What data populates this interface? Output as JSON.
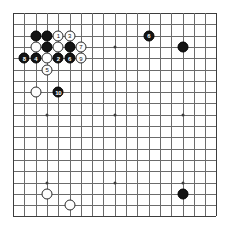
{
  "diagram": {
    "type": "go-board",
    "board_size": 19,
    "colors": {
      "background": "#ffffff",
      "grid": "#6b6b6b",
      "grid_edge": "#3d3d3d",
      "black_stone": "#141414",
      "white_stone": "#fdfdfd",
      "black_label": "#ffffff",
      "white_label": "#111111"
    },
    "geometry": {
      "origin_x": 13,
      "origin_y": 13,
      "spacing": 11.3,
      "stone_diameter": 11,
      "hoshi_points": [
        [
          3,
          3
        ],
        [
          9,
          3
        ],
        [
          15,
          3
        ],
        [
          3,
          9
        ],
        [
          9,
          9
        ],
        [
          15,
          9
        ],
        [
          3,
          15
        ],
        [
          9,
          15
        ],
        [
          15,
          15
        ]
      ]
    },
    "stones": [
      {
        "id": "b-c17",
        "color": "black",
        "col": 2,
        "row": 2,
        "label": ""
      },
      {
        "id": "b-d17",
        "color": "black",
        "col": 3,
        "row": 2,
        "label": ""
      },
      {
        "id": "w-e17",
        "color": "white",
        "col": 4,
        "row": 2,
        "label": "1"
      },
      {
        "id": "w-f17",
        "color": "white",
        "col": 5,
        "row": 2,
        "label": "3"
      },
      {
        "id": "w-c16",
        "color": "white",
        "col": 2,
        "row": 3,
        "label": ""
      },
      {
        "id": "b-d16",
        "color": "black",
        "col": 3,
        "row": 3,
        "label": ""
      },
      {
        "id": "w-e16",
        "color": "white",
        "col": 4,
        "row": 3,
        "label": ""
      },
      {
        "id": "b-f16",
        "color": "black",
        "col": 5,
        "row": 3,
        "label": ""
      },
      {
        "id": "w-g16",
        "color": "white",
        "col": 6,
        "row": 3,
        "label": "7"
      },
      {
        "id": "b-a15",
        "color": "black",
        "col": 1,
        "row": 4,
        "label": "8"
      },
      {
        "id": "b-b15",
        "color": "black",
        "col": 2,
        "row": 4,
        "label": "4"
      },
      {
        "id": "w-c15",
        "color": "white",
        "col": 3,
        "row": 4,
        "label": ""
      },
      {
        "id": "b-d15",
        "color": "black",
        "col": 4,
        "row": 4,
        "label": "2"
      },
      {
        "id": "b-e15",
        "color": "black",
        "col": 5,
        "row": 4,
        "label": "6"
      },
      {
        "id": "w-g15",
        "color": "white",
        "col": 6,
        "row": 4,
        "label": "9"
      },
      {
        "id": "w-c13",
        "color": "white",
        "col": 3,
        "row": 5,
        "label": "5"
      },
      {
        "id": "w-b12",
        "color": "white",
        "col": 2,
        "row": 7,
        "label": ""
      },
      {
        "id": "b-d12",
        "color": "black",
        "col": 4,
        "row": 7,
        "label": "10"
      },
      {
        "id": "b-p17",
        "color": "black",
        "col": 12,
        "row": 2,
        "label": "6"
      },
      {
        "id": "b-q16",
        "color": "black",
        "col": 15,
        "row": 3,
        "label": ""
      },
      {
        "id": "w-d4",
        "color": "white",
        "col": 3,
        "row": 16,
        "label": ""
      },
      {
        "id": "w-f3",
        "color": "white",
        "col": 5,
        "row": 17,
        "label": ""
      },
      {
        "id": "b-q4",
        "color": "black",
        "col": 15,
        "row": 16,
        "label": ""
      }
    ]
  }
}
